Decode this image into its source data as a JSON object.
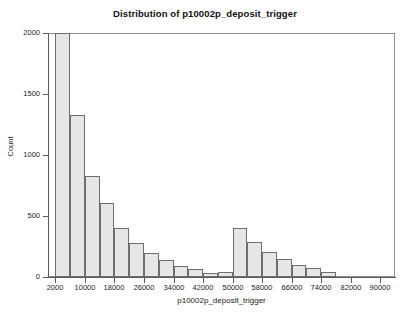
{
  "chart_data": {
    "type": "bar",
    "subtype": "histogram",
    "title": "Distribution of p10002p_deposit_trigger",
    "xlabel": "p10002p_deposit_trigger",
    "ylabel": "Count",
    "grid": false,
    "legend": null,
    "xlim": [
      0,
      94000
    ],
    "ylim": [
      0,
      2000
    ],
    "xticks": [
      2000,
      10000,
      18000,
      26000,
      34000,
      42000,
      50000,
      58000,
      66000,
      74000,
      82000,
      90000
    ],
    "xtick_labels": [
      "2000",
      "10000",
      "18000",
      "26000",
      "34000",
      "42000",
      "50000",
      "58000",
      "66000",
      "74000",
      "82000",
      "90000"
    ],
    "yticks": [
      0,
      500,
      1000,
      1500,
      2000
    ],
    "ytick_labels": [
      "0",
      "500",
      "1000",
      "1500",
      "2000"
    ],
    "bin_width": 4000,
    "bin_starts": [
      2000,
      6000,
      10000,
      14000,
      18000,
      22000,
      26000,
      30000,
      34000,
      38000,
      42000,
      46000,
      50000,
      54000,
      58000,
      62000,
      66000,
      70000,
      74000
    ],
    "values": [
      2000,
      1330,
      825,
      610,
      400,
      275,
      198,
      140,
      92,
      66,
      30,
      38,
      405,
      288,
      205,
      150,
      100,
      72,
      42
    ],
    "bars": [
      {
        "x0": 2000,
        "x1": 6000,
        "count": 2000
      },
      {
        "x0": 6000,
        "x1": 10000,
        "count": 1330
      },
      {
        "x0": 10000,
        "x1": 14000,
        "count": 825
      },
      {
        "x0": 14000,
        "x1": 18000,
        "count": 610
      },
      {
        "x0": 18000,
        "x1": 22000,
        "count": 400
      },
      {
        "x0": 22000,
        "x1": 26000,
        "count": 275
      },
      {
        "x0": 26000,
        "x1": 30000,
        "count": 198
      },
      {
        "x0": 30000,
        "x1": 34000,
        "count": 140
      },
      {
        "x0": 34000,
        "x1": 38000,
        "count": 92
      },
      {
        "x0": 38000,
        "x1": 42000,
        "count": 66
      },
      {
        "x0": 42000,
        "x1": 46000,
        "count": 30
      },
      {
        "x0": 46000,
        "x1": 50000,
        "count": 38
      },
      {
        "x0": 50000,
        "x1": 54000,
        "count": 405
      },
      {
        "x0": 54000,
        "x1": 58000,
        "count": 288
      },
      {
        "x0": 58000,
        "x1": 62000,
        "count": 205
      },
      {
        "x0": 62000,
        "x1": 66000,
        "count": 150
      },
      {
        "x0": 66000,
        "x1": 70000,
        "count": 100
      },
      {
        "x0": 70000,
        "x1": 74000,
        "count": 72
      },
      {
        "x0": 74000,
        "x1": 78000,
        "count": 42
      }
    ],
    "colors": {
      "bar_fill": "#e6e6e6",
      "bar_edge": "#6e6e6e",
      "axis": "#5a5a5a",
      "frame": "#8d8d8d",
      "text": "#1a1a1a",
      "background": "#ffffff"
    }
  }
}
